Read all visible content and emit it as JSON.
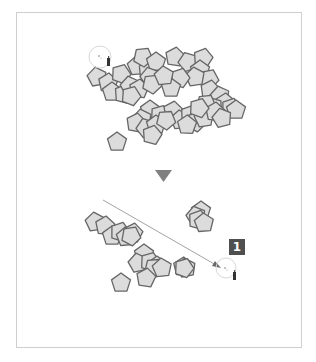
{
  "diagram": {
    "colors": {
      "pentagon_fill": "#dcdcdc",
      "pentagon_stroke": "#666666",
      "frame_border": "#cfcfcf",
      "arrow": "#808080",
      "drag_line": "#8a8a8a",
      "badge_bg": "#4f4f4f",
      "badge_text": "#ffffff"
    },
    "step_badge": {
      "label": "1"
    },
    "before": {
      "cursor": {
        "x": 104,
        "y": 59,
        "icon": "spray-can-cursor-icon"
      },
      "pentagons": [
        [
          97,
          77,
          -10
        ],
        [
          108,
          83,
          5
        ],
        [
          121,
          74,
          20
        ],
        [
          137,
          66,
          -5
        ],
        [
          148,
          71,
          12
        ],
        [
          143,
          57,
          30
        ],
        [
          156,
          62,
          0
        ],
        [
          150,
          77,
          -15
        ],
        [
          175,
          57,
          8
        ],
        [
          188,
          62,
          -20
        ],
        [
          203,
          58,
          15
        ],
        [
          200,
          70,
          0
        ],
        [
          209,
          79,
          25
        ],
        [
          195,
          77,
          -8
        ],
        [
          180,
          78,
          18
        ],
        [
          171,
          88,
          0
        ],
        [
          112,
          92,
          0
        ],
        [
          124,
          94,
          14
        ],
        [
          130,
          86,
          -12
        ],
        [
          139,
          89,
          6
        ],
        [
          131,
          96,
          22
        ],
        [
          152,
          84,
          30
        ],
        [
          164,
          76,
          -6
        ],
        [
          210,
          90,
          10
        ],
        [
          220,
          96,
          -12
        ],
        [
          225,
          103,
          4
        ],
        [
          231,
          108,
          18
        ],
        [
          236,
          110,
          0
        ],
        [
          213,
          107,
          -20
        ],
        [
          206,
          104,
          30
        ],
        [
          150,
          110,
          0
        ],
        [
          142,
          119,
          -10
        ],
        [
          160,
          115,
          20
        ],
        [
          173,
          111,
          8
        ],
        [
          180,
          120,
          -5
        ],
        [
          190,
          115,
          16
        ],
        [
          196,
          122,
          28
        ],
        [
          187,
          125,
          2
        ],
        [
          136,
          123,
          10
        ],
        [
          146,
          128,
          -20
        ],
        [
          156,
          125,
          0
        ],
        [
          152,
          135,
          14
        ],
        [
          166,
          120,
          32
        ],
        [
          204,
          118,
          -8
        ],
        [
          117,
          142,
          0
        ],
        [
          215,
          112,
          6
        ],
        [
          222,
          118,
          -14
        ],
        [
          199,
          108,
          20
        ]
      ]
    },
    "after": {
      "cursor": {
        "x": 225,
        "y": 270,
        "icon": "spray-can-cursor-icon"
      },
      "drag_line": {
        "x1": 103,
        "y1": 200,
        "x2": 220,
        "y2": 268
      },
      "pentagons": [
        [
          95,
          222,
          -8
        ],
        [
          105,
          226,
          6
        ],
        [
          112,
          236,
          0
        ],
        [
          120,
          232,
          18
        ],
        [
          126,
          237,
          -4
        ],
        [
          133,
          233,
          10
        ],
        [
          131,
          236,
          28
        ],
        [
          144,
          254,
          0
        ],
        [
          138,
          263,
          -12
        ],
        [
          150,
          262,
          20
        ],
        [
          157,
          266,
          0
        ],
        [
          154,
          268,
          32
        ],
        [
          162,
          268,
          -6
        ],
        [
          146,
          278,
          8
        ],
        [
          121,
          283,
          0
        ],
        [
          183,
          267,
          4
        ],
        [
          186,
          268,
          -10
        ],
        [
          184,
          268,
          20
        ],
        [
          201,
          211,
          0
        ],
        [
          196,
          216,
          -14
        ],
        [
          198,
          220,
          16
        ],
        [
          204,
          223,
          -4
        ]
      ]
    },
    "transition_arrow": {
      "icon": "down-triangle-arrow-icon",
      "x": 163,
      "y": 176
    }
  }
}
